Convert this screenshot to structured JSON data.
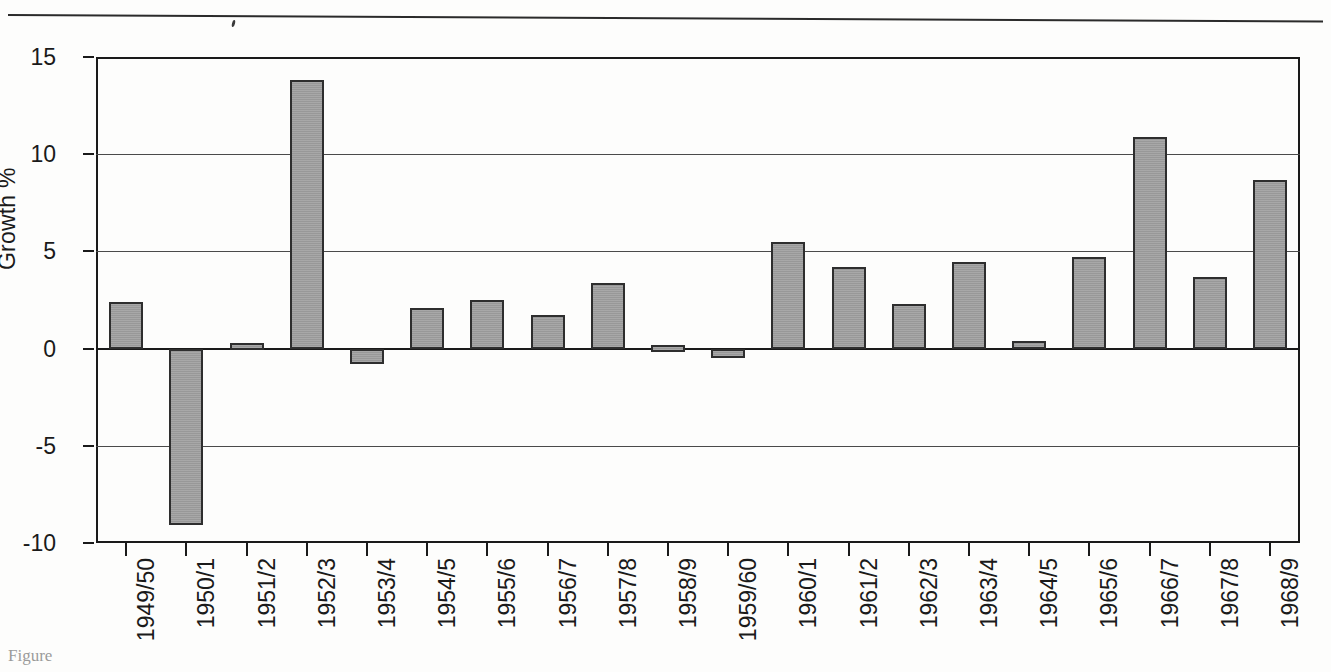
{
  "figure": {
    "caption_fragment": "Figure"
  },
  "chart_data": {
    "type": "bar",
    "title": "",
    "xlabel": "",
    "ylabel": "Growth %",
    "ylim": [
      -10,
      15
    ],
    "yticks": [
      15,
      10,
      5,
      0,
      -5,
      -10
    ],
    "ytick_labels": [
      "15",
      "10",
      "5",
      "0",
      "-5",
      "-10"
    ],
    "grid": true,
    "legend": "none",
    "bar_color": "#9e9e9e",
    "bar_edge_color": "#2e2e2e",
    "axis_color": "#1a1a1a",
    "categories": [
      "1949/50",
      "1950/1",
      "1951/2",
      "1952/3",
      "1953/4",
      "1954/5",
      "1955/6",
      "1956/7",
      "1957/8",
      "1958/9",
      "1959/60",
      "1960/1",
      "1961/2",
      "1962/3",
      "1963/4",
      "1964/5",
      "1965/6",
      "1966/7",
      "1967/8",
      "1968/9"
    ],
    "values": [
      2.4,
      -9.1,
      0.3,
      13.8,
      -0.8,
      2.1,
      2.5,
      1.75,
      3.4,
      0.2,
      -0.5,
      5.5,
      4.2,
      2.3,
      4.45,
      0.4,
      4.7,
      10.9,
      3.7,
      8.65
    ]
  }
}
